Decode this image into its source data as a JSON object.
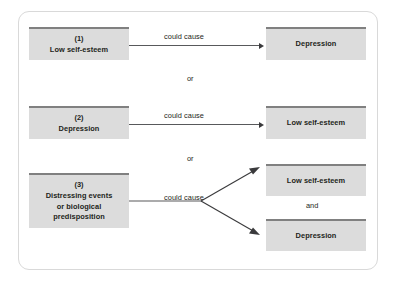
{
  "diagram": {
    "colors": {
      "panel_border": "#d9d9d9",
      "box_fill": "#dcdcdc",
      "box_top_accent": "#808080",
      "arrow": "#58595b",
      "text": "#231f20",
      "background": "#ffffff"
    },
    "rows": [
      {
        "number": "(1)",
        "cause_lines": [
          "(1)",
          "Low self-esteem"
        ],
        "relation": "could cause",
        "effect_boxes": [
          "Depression"
        ],
        "effect_joiner": null,
        "connector_below": "or"
      },
      {
        "number": "(2)",
        "cause_lines": [
          "(2)",
          "Depression"
        ],
        "relation": "could cause",
        "effect_boxes": [
          "Low self-esteem"
        ],
        "effect_joiner": null,
        "connector_below": "or"
      },
      {
        "number": "(3)",
        "cause_lines": [
          "(3)",
          "Distressing events",
          "or biological",
          "predisposition"
        ],
        "relation": "could cause",
        "effect_boxes": [
          "Low self-esteem",
          "Depression"
        ],
        "effect_joiner": "and",
        "connector_below": null
      }
    ]
  }
}
